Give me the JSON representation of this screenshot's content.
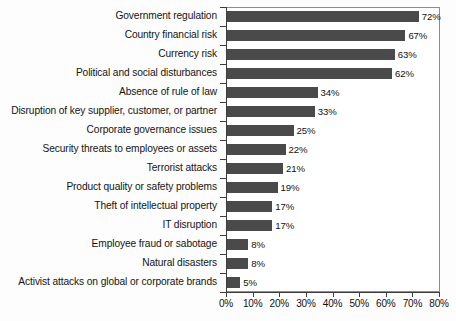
{
  "chart_data": {
    "type": "bar",
    "orientation": "horizontal",
    "title": "",
    "subtitle": "",
    "xlabel": "",
    "ylabel": "",
    "xlim": [
      0,
      80
    ],
    "xtick_step": 10,
    "grid": false,
    "legend": null,
    "bar_color": "#4a4a4a",
    "axis_color": "#3d3d3d",
    "frame_color": "#8c8c8c",
    "background_color": "#fdfdfd",
    "value_suffix": "%",
    "categories": [
      "Government regulation",
      "Country financial risk",
      "Currency risk",
      "Political and social disturbances",
      "Absence of rule of law",
      "Disruption of key supplier, customer, or partner",
      "Corporate governance issues",
      "Security threats to employees or assets",
      "Terrorist attacks",
      "Product quality or safety problems",
      "Theft of intellectual property",
      "IT disruption",
      "Employee fraud or sabotage",
      "Natural disasters",
      "Activist attacks on global or corporate brands"
    ],
    "values": [
      72,
      67,
      63,
      62,
      34,
      33,
      25,
      22,
      21,
      19,
      17,
      17,
      8,
      8,
      5
    ],
    "value_labels": [
      "72%",
      "67%",
      "63%",
      "62%",
      "34%",
      "33%",
      "25%",
      "22%",
      "21%",
      "19%",
      "17%",
      "17%",
      "8%",
      "8%",
      "5%"
    ],
    "xticks": [
      0,
      10,
      20,
      30,
      40,
      50,
      60,
      70,
      80
    ],
    "xtick_labels": [
      "0%",
      "10%",
      "20%",
      "30%",
      "40%",
      "50%",
      "60%",
      "70%",
      "80%"
    ]
  }
}
